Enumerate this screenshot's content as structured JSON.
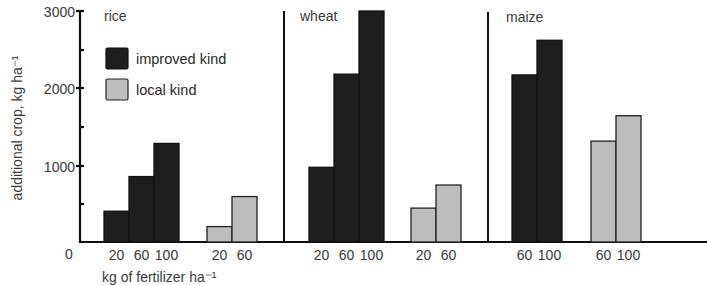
{
  "chart_data": {
    "type": "bar",
    "title": "",
    "xlabel": "kg of fertilizer ha⁻¹",
    "ylabel": "additional crop, kg ha⁻¹",
    "ylim": [
      0,
      3000
    ],
    "yticks": [
      0,
      1000,
      2000,
      3000
    ],
    "yticks_minor": [
      500,
      1500,
      2500
    ],
    "grid": false,
    "legend": {
      "position": "upper-left (inside rice panel)",
      "entries": [
        {
          "label": "improved kind",
          "color": "#1e1e1e"
        },
        {
          "label": "local kind",
          "color": "#bdbdbd"
        }
      ]
    },
    "groups": [
      {
        "name": "rice",
        "series": [
          {
            "name": "improved kind",
            "fertilizer": [
              "20",
              "60",
              "100"
            ],
            "values": [
              400,
              850,
              1280
            ]
          },
          {
            "name": "local kind",
            "fertilizer": [
              "20",
              "60"
            ],
            "values": [
              200,
              590
            ]
          }
        ]
      },
      {
        "name": "wheat",
        "series": [
          {
            "name": "improved kind",
            "fertilizer": [
              "20",
              "60",
              "100"
            ],
            "values": [
              970,
              2180,
              3000
            ]
          },
          {
            "name": "local kind",
            "fertilizer": [
              "20",
              "60"
            ],
            "values": [
              440,
              740
            ]
          }
        ]
      },
      {
        "name": "maize",
        "series": [
          {
            "name": "improved kind",
            "fertilizer": [
              "60",
              "100"
            ],
            "values": [
              2170,
              2620
            ]
          },
          {
            "name": "local kind",
            "fertilizer": [
              "60",
              "100"
            ],
            "values": [
              1310,
              1640
            ]
          }
        ]
      }
    ]
  },
  "labels": {
    "y3000": "3000",
    "y2000": "2000",
    "y1000": "1000",
    "y0": "0",
    "rice": "rice",
    "wheat": "wheat",
    "maize": "maize",
    "legend_improved": "improved kind",
    "legend_local": "local kind",
    "xlabel": "kg of fertilizer ha⁻¹",
    "ylabel": "additional crop, kg ha⁻¹"
  }
}
